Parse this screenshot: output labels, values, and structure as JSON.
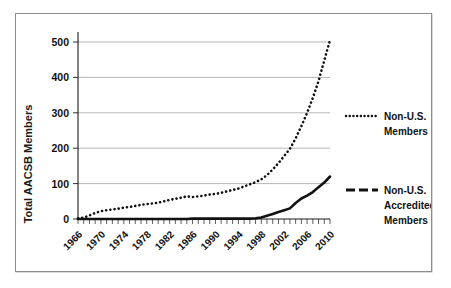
{
  "chart_data": {
    "type": "line",
    "title": "",
    "xlabel": "",
    "ylabel": "Total AACSB Members",
    "xlim": [
      1966,
      2010
    ],
    "ylim": [
      0,
      500
    ],
    "yticks": [
      0,
      100,
      200,
      300,
      400,
      500
    ],
    "xticks": [
      1966,
      1970,
      1974,
      1978,
      1982,
      1986,
      1990,
      1994,
      1998,
      2002,
      2006,
      2010
    ],
    "xtick_labels": [
      "1966",
      "1970",
      "1974",
      "1978",
      "1982",
      "1986",
      "1990",
      "1994",
      "1998",
      "2002",
      "2006",
      "2010"
    ],
    "ytick_labels": [
      "0",
      "100",
      "200",
      "300",
      "400",
      "500"
    ],
    "grid": "horizontal",
    "legend_position": "right",
    "x": [
      1966,
      1967,
      1968,
      1969,
      1970,
      1971,
      1972,
      1973,
      1974,
      1975,
      1976,
      1977,
      1978,
      1979,
      1980,
      1981,
      1982,
      1983,
      1984,
      1985,
      1986,
      1987,
      1988,
      1989,
      1990,
      1991,
      1992,
      1993,
      1994,
      1995,
      1996,
      1997,
      1998,
      1999,
      2000,
      2001,
      2002,
      2003,
      2004,
      2005,
      2006,
      2007,
      2008,
      2009,
      2010
    ],
    "series": [
      {
        "name": "Non-U.S. Members",
        "style": "dotted",
        "values": [
          2,
          4,
          10,
          17,
          22,
          25,
          27,
          29,
          32,
          34,
          37,
          40,
          42,
          44,
          46,
          50,
          54,
          57,
          60,
          64,
          62,
          64,
          66,
          69,
          71,
          74,
          78,
          82,
          86,
          92,
          98,
          104,
          112,
          124,
          140,
          158,
          178,
          198,
          228,
          262,
          300,
          342,
          390,
          448,
          505
        ]
      },
      {
        "name": "Non-U.S. Accredited Members",
        "style": "solid",
        "values": [
          0,
          0,
          0,
          0,
          0,
          0,
          0,
          0,
          0,
          0,
          0,
          0,
          0,
          0,
          0,
          0,
          0,
          0,
          0,
          0,
          1,
          1,
          1,
          1,
          1,
          1,
          1,
          1,
          1,
          1,
          1,
          2,
          4,
          9,
          14,
          20,
          25,
          30,
          45,
          58,
          66,
          76,
          90,
          103,
          120
        ]
      }
    ],
    "legend": [
      {
        "label_lines": [
          "Non-U.S.",
          "Members"
        ],
        "style": "dotted"
      },
      {
        "label_lines": [
          "Non-U.S.",
          "Accredited",
          "Members"
        ],
        "style": "dashed"
      }
    ],
    "colors": {
      "series": "#111111",
      "grid": "#9a9a9a",
      "axis": "#1a1a1a",
      "frame": "#8d8d8d",
      "background": "#ffffff"
    }
  }
}
